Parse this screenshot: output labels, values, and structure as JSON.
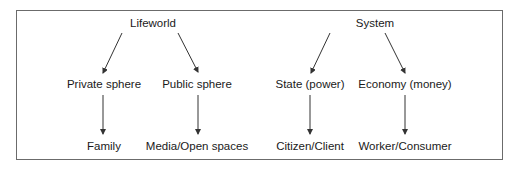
{
  "diagram": {
    "type": "hierarchy",
    "trees": [
      {
        "root": "Lifeworld",
        "children": [
          {
            "label": "Private sphere",
            "child": "Family"
          },
          {
            "label": "Public sphere",
            "child": "Media/Open spaces"
          }
        ]
      },
      {
        "root": "System",
        "children": [
          {
            "label": "State (power)",
            "child": "Citizen/Client"
          },
          {
            "label": "Economy (money)",
            "child": "Worker/Consumer"
          }
        ]
      }
    ],
    "colors": {
      "border": "#6b6b6b",
      "arrow": "#333333",
      "text": "#1a1a1a"
    }
  }
}
